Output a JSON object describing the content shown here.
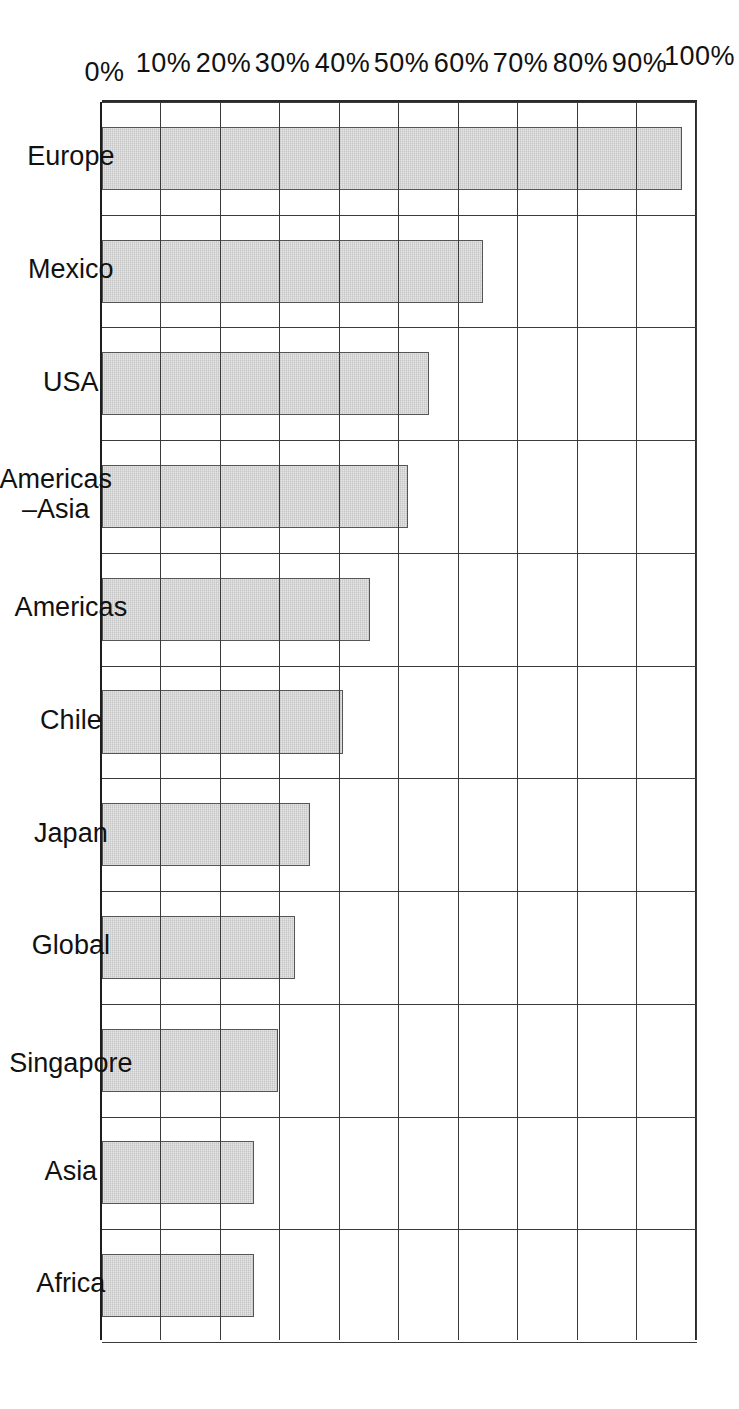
{
  "figure": {
    "orientation": "rotated-90",
    "background": "#ffffff",
    "bar_fill": "#c6c6c6",
    "bar_stroke": "#555555",
    "grid_color": "#3a3a3a"
  },
  "chart_data": {
    "type": "bar",
    "title": "",
    "xlabel": "",
    "ylabel": "",
    "ylim": [
      0,
      100
    ],
    "grid": true,
    "legend": null,
    "orientation": "horizontal-printed-rotated",
    "categories": [
      "Europe",
      "Mexico",
      "USA",
      "Americas\n–Asia",
      "Americas",
      "Chile",
      "Japan",
      "Global",
      "Singapore",
      "Asia",
      "Africa"
    ],
    "values": [
      97.5,
      64,
      55,
      51.5,
      45,
      40.5,
      35,
      32.5,
      29.5,
      25.5,
      25.5
    ],
    "tick_labels": [
      "100%",
      "90%",
      "80%",
      "70%",
      "60%",
      "50%",
      "40%",
      "30%",
      "20%",
      "10%",
      "0%"
    ],
    "tick_values": [
      100,
      90,
      80,
      70,
      60,
      50,
      40,
      30,
      20,
      10,
      0
    ]
  }
}
